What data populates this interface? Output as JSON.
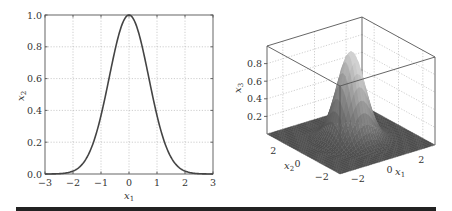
{
  "chart_data": [
    {
      "type": "line",
      "title": "",
      "xlabel": "x1",
      "ylabel": "x2",
      "function": "x2 = exp(-x1^2)",
      "xlim": [
        -3,
        3
      ],
      "ylim": [
        0,
        1
      ],
      "xticks": [
        -3,
        -2,
        -1,
        0,
        1,
        2,
        3
      ],
      "xtick_labels": [
        "−3",
        "−2",
        "−1",
        "0",
        "1",
        "2",
        "3"
      ],
      "yticks": [
        0,
        0.2,
        0.4,
        0.6,
        0.8,
        1.0
      ],
      "ytick_labels": [
        "0.0",
        "0.2",
        "0.4",
        "0.6",
        "0.8",
        "1.0"
      ],
      "grid": true,
      "series": [
        {
          "name": "gaussian",
          "color": "#444444",
          "x": [
            -3,
            -2.5,
            -2,
            -1.5,
            -1,
            -0.5,
            0,
            0.5,
            1,
            1.5,
            2,
            2.5,
            3
          ],
          "y": [
            0.0001,
            0.0019,
            0.0183,
            0.1054,
            0.3679,
            0.7788,
            1.0,
            0.7788,
            0.3679,
            0.1054,
            0.0183,
            0.0019,
            0.0001
          ]
        }
      ]
    },
    {
      "type": "surface",
      "title": "",
      "xlabel": "x1",
      "ylabel": "x2",
      "zlabel": "x3",
      "function": "x3 = exp(-(x1^2 + x2^2))",
      "xlim": [
        -3,
        3
      ],
      "ylim": [
        -3,
        3
      ],
      "zlim": [
        0,
        1
      ],
      "xticks": [
        -2,
        0,
        2
      ],
      "xtick_labels": [
        "−2",
        "0",
        "2"
      ],
      "yticks": [
        -2,
        0,
        2
      ],
      "ytick_labels": [
        "−2",
        "0",
        "2"
      ],
      "zticks": [
        0.2,
        0.4,
        0.6,
        0.8
      ],
      "ztick_labels": [
        "0.2",
        "0.4",
        "0.6",
        "0.8"
      ],
      "grid": true,
      "peak": {
        "x1": 0,
        "x2": 0,
        "x3": 1.0
      },
      "colormap": "gray"
    }
  ],
  "labels": {
    "left_x": "x",
    "left_x_sub": "1",
    "left_y": "x",
    "left_y_sub": "2",
    "right_x1": "x",
    "right_x1_sub": "1",
    "right_x2": "x",
    "right_x2_sub": "2",
    "right_x3": "x",
    "right_x3_sub": "3"
  }
}
